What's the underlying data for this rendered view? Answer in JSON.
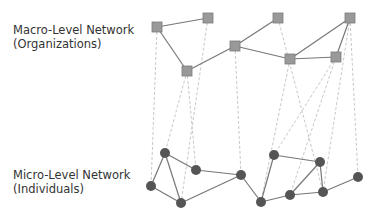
{
  "labels": {
    "macro_title": "Macro-Level Network",
    "macro_sub": "(Organizations)",
    "micro_title": "Micro-Level Network",
    "micro_sub": "(Individuals)"
  },
  "colors": {
    "square_fill": "#999999",
    "square_stroke": "#7a7a7a",
    "circle_fill": "#555555",
    "edge": "#777777",
    "dashed": "#c8c8c8"
  },
  "macro_nodes": [
    {
      "id": "A",
      "x": 157,
      "y": 27
    },
    {
      "id": "B",
      "x": 208,
      "y": 18
    },
    {
      "id": "C",
      "x": 187,
      "y": 71
    },
    {
      "id": "D",
      "x": 235,
      "y": 46
    },
    {
      "id": "E",
      "x": 278,
      "y": 18
    },
    {
      "id": "F",
      "x": 290,
      "y": 59
    },
    {
      "id": "G",
      "x": 336,
      "y": 57
    },
    {
      "id": "H",
      "x": 350,
      "y": 18
    }
  ],
  "macro_edges": [
    [
      "A",
      "B"
    ],
    [
      "A",
      "C"
    ],
    [
      "C",
      "D"
    ],
    [
      "D",
      "E"
    ],
    [
      "D",
      "F"
    ],
    [
      "F",
      "G"
    ],
    [
      "F",
      "H"
    ],
    [
      "G",
      "H"
    ]
  ],
  "micro_nodes": [
    {
      "id": "a",
      "x": 165,
      "y": 153
    },
    {
      "id": "b",
      "x": 196,
      "y": 170
    },
    {
      "id": "c",
      "x": 241,
      "y": 175
    },
    {
      "id": "d",
      "x": 151,
      "y": 186
    },
    {
      "id": "e",
      "x": 181,
      "y": 203
    },
    {
      "id": "f",
      "x": 274,
      "y": 155
    },
    {
      "id": "g",
      "x": 320,
      "y": 162
    },
    {
      "id": "h",
      "x": 261,
      "y": 202
    },
    {
      "id": "i",
      "x": 290,
      "y": 195
    },
    {
      "id": "j",
      "x": 323,
      "y": 192
    },
    {
      "id": "k",
      "x": 358,
      "y": 177
    }
  ],
  "micro_edges": [
    [
      "a",
      "b"
    ],
    [
      "a",
      "d"
    ],
    [
      "a",
      "e"
    ],
    [
      "d",
      "e"
    ],
    [
      "b",
      "c"
    ],
    [
      "e",
      "c"
    ],
    [
      "c",
      "h"
    ],
    [
      "f",
      "h"
    ],
    [
      "f",
      "g"
    ],
    [
      "g",
      "i"
    ],
    [
      "g",
      "j"
    ],
    [
      "h",
      "i"
    ],
    [
      "i",
      "j"
    ],
    [
      "j",
      "k"
    ]
  ],
  "cross_links": [
    [
      "A",
      "d"
    ],
    [
      "B",
      "e"
    ],
    [
      "C",
      "a"
    ],
    [
      "C",
      "b"
    ],
    [
      "D",
      "c"
    ],
    [
      "E",
      "j"
    ],
    [
      "F",
      "h"
    ],
    [
      "G",
      "f"
    ],
    [
      "G",
      "i"
    ],
    [
      "H",
      "j"
    ],
    [
      "H",
      "k"
    ]
  ]
}
